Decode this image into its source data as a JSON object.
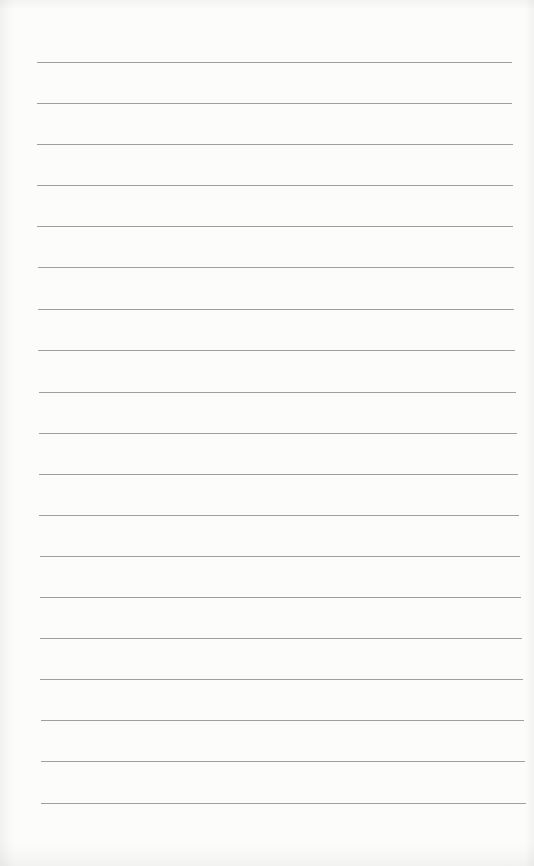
{
  "page": {
    "type": "lined-paper",
    "background_color": "#fcfcfb",
    "line_color": "#8e8e8e",
    "line_count": 19
  },
  "lines": [
    {
      "y": 62,
      "x1": 37,
      "x2": 512
    },
    {
      "y": 103,
      "x1": 37,
      "x2": 512
    },
    {
      "y": 144,
      "x1": 37,
      "x2": 513
    },
    {
      "y": 185,
      "x1": 37,
      "x2": 513
    },
    {
      "y": 226,
      "x1": 37,
      "x2": 513
    },
    {
      "y": 267,
      "x1": 38,
      "x2": 514
    },
    {
      "y": 309,
      "x1": 38,
      "x2": 514
    },
    {
      "y": 350,
      "x1": 38,
      "x2": 515
    },
    {
      "y": 392,
      "x1": 39,
      "x2": 516
    },
    {
      "y": 433,
      "x1": 39,
      "x2": 517
    },
    {
      "y": 474,
      "x1": 39,
      "x2": 518
    },
    {
      "y": 515,
      "x1": 39,
      "x2": 519
    },
    {
      "y": 556,
      "x1": 40,
      "x2": 520
    },
    {
      "y": 597,
      "x1": 40,
      "x2": 521
    },
    {
      "y": 638,
      "x1": 40,
      "x2": 522
    },
    {
      "y": 679,
      "x1": 40,
      "x2": 523
    },
    {
      "y": 720,
      "x1": 41,
      "x2": 524
    },
    {
      "y": 761,
      "x1": 41,
      "x2": 525
    },
    {
      "y": 803,
      "x1": 41,
      "x2": 526
    }
  ]
}
